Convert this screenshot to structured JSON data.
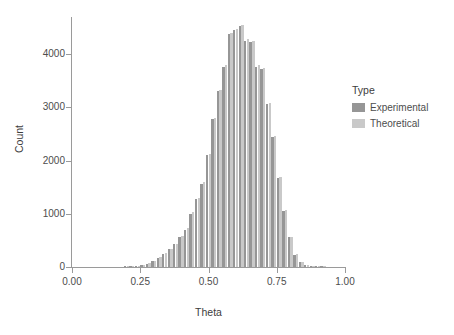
{
  "chart_data": {
    "type": "bar",
    "title": "",
    "subtitle": "",
    "xlabel": "Theta",
    "ylabel": "Count",
    "xlim": [
      0.0,
      1.0
    ],
    "ylim": [
      0,
      4700
    ],
    "grid": false,
    "legend_position": "right",
    "legend_title": "Type",
    "bar_mode": "dodge",
    "x_ticks": [
      "0.00",
      "0.25",
      "0.50",
      "0.75",
      "1.00"
    ],
    "x_tick_values": [
      0.0,
      0.25,
      0.5,
      0.75,
      1.0
    ],
    "y_ticks": [
      "0",
      "1000",
      "2000",
      "3000",
      "4000"
    ],
    "y_tick_values": [
      0,
      1000,
      2000,
      3000,
      4000
    ],
    "colors": {
      "experimental": "#969696",
      "theoretical": "#c9c9c9",
      "axis": "#9a9a9a",
      "text": "#4d4d4d",
      "background": "#ffffff"
    },
    "bin_width": 0.02,
    "categories": [
      0.2,
      0.22,
      0.24,
      0.26,
      0.28,
      0.3,
      0.32,
      0.34,
      0.36,
      0.38,
      0.4,
      0.42,
      0.44,
      0.46,
      0.48,
      0.5,
      0.52,
      0.54,
      0.56,
      0.58,
      0.6,
      0.62,
      0.64,
      0.66,
      0.68,
      0.7,
      0.72,
      0.74,
      0.76,
      0.78,
      0.8,
      0.82,
      0.84,
      0.86,
      0.88,
      0.9,
      0.92
    ],
    "series": [
      {
        "name": "Experimental",
        "color": "#969696",
        "values": [
          10,
          15,
          25,
          40,
          60,
          110,
          170,
          250,
          330,
          430,
          560,
          700,
          1000,
          1270,
          1560,
          2100,
          2780,
          3300,
          3760,
          4380,
          4450,
          4530,
          4250,
          4230,
          3760,
          3730,
          3060,
          2440,
          1680,
          1050,
          560,
          230,
          90,
          40,
          20,
          10,
          5
        ]
      },
      {
        "name": "Theoretical",
        "color": "#c9c9c9",
        "values": [
          12,
          18,
          28,
          45,
          70,
          120,
          180,
          260,
          340,
          440,
          580,
          730,
          1030,
          1300,
          1590,
          2130,
          2800,
          3330,
          3800,
          4400,
          4470,
          4550,
          4280,
          4250,
          3790,
          3750,
          3090,
          2460,
          1700,
          1070,
          570,
          240,
          95,
          45,
          22,
          11,
          6
        ]
      }
    ],
    "annotations": []
  }
}
